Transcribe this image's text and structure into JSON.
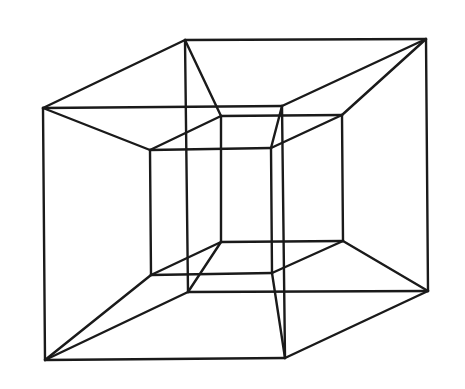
{
  "diagram": {
    "caption": "",
    "stroke_color": "#1a1a1a",
    "background": "#ffffff",
    "vertices": {
      "A": [
        43,
        108
      ],
      "B": [
        282,
        106
      ],
      "C": [
        285,
        358
      ],
      "D": [
        45,
        360
      ],
      "E": [
        185,
        40
      ],
      "F": [
        426,
        39
      ],
      "G": [
        428,
        291
      ],
      "H": [
        188,
        292
      ],
      "I": [
        150,
        150
      ],
      "J": [
        271,
        148
      ],
      "K": [
        272,
        273
      ],
      "L": [
        151,
        275
      ],
      "M": [
        221,
        116
      ],
      "N": [
        342,
        115
      ],
      "O": [
        343,
        241
      ],
      "P": [
        221,
        242
      ]
    },
    "edges": [
      [
        "A",
        "B"
      ],
      [
        "B",
        "C"
      ],
      [
        "C",
        "D"
      ],
      [
        "D",
        "A"
      ],
      [
        "E",
        "F"
      ],
      [
        "F",
        "G"
      ],
      [
        "G",
        "H"
      ],
      [
        "H",
        "E"
      ],
      [
        "A",
        "E"
      ],
      [
        "B",
        "F"
      ],
      [
        "C",
        "G"
      ],
      [
        "D",
        "H"
      ],
      [
        "I",
        "J"
      ],
      [
        "J",
        "K"
      ],
      [
        "K",
        "L"
      ],
      [
        "L",
        "I"
      ],
      [
        "M",
        "N"
      ],
      [
        "N",
        "O"
      ],
      [
        "O",
        "P"
      ],
      [
        "P",
        "M"
      ],
      [
        "I",
        "M"
      ],
      [
        "J",
        "N"
      ],
      [
        "K",
        "O"
      ],
      [
        "L",
        "P"
      ],
      [
        "A",
        "I"
      ],
      [
        "B",
        "J"
      ],
      [
        "C",
        "K"
      ],
      [
        "D",
        "L"
      ],
      [
        "E",
        "M"
      ],
      [
        "F",
        "N"
      ],
      [
        "G",
        "O"
      ],
      [
        "H",
        "P"
      ]
    ]
  }
}
